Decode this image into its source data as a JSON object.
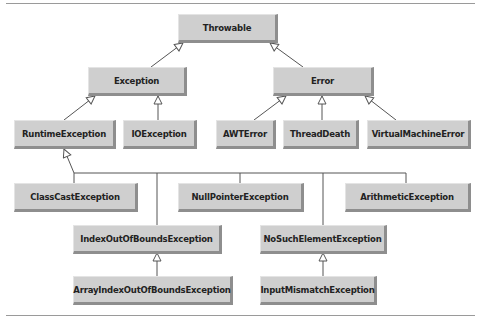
{
  "diagram": {
    "nodes": [
      {
        "id": "throwable",
        "label": "Throwable",
        "parent": null
      },
      {
        "id": "exception",
        "label": "Exception",
        "parent": "throwable"
      },
      {
        "id": "error",
        "label": "Error",
        "parent": "throwable"
      },
      {
        "id": "runtime",
        "label": "RuntimeException",
        "parent": "exception"
      },
      {
        "id": "io",
        "label": "IOException",
        "parent": "exception"
      },
      {
        "id": "awt",
        "label": "AWTError",
        "parent": "error"
      },
      {
        "id": "threaddeath",
        "label": "ThreadDeath",
        "parent": "error"
      },
      {
        "id": "vme",
        "label": "VirtualMachineError",
        "parent": "error"
      },
      {
        "id": "classcast",
        "label": "ClassCastException",
        "parent": "runtime"
      },
      {
        "id": "nullpointer",
        "label": "NullPointerException",
        "parent": "runtime"
      },
      {
        "id": "arithmetic",
        "label": "ArithmeticException",
        "parent": "runtime"
      },
      {
        "id": "ioob",
        "label": "IndexOutOfBoundsException",
        "parent": "runtime"
      },
      {
        "id": "nosuch",
        "label": "NoSuchElementException",
        "parent": "runtime"
      },
      {
        "id": "aioob",
        "label": "ArrayIndexOutOfBoundsException",
        "parent": "ioob"
      },
      {
        "id": "inputmismatch",
        "label": "InputMismatchException",
        "parent": "nosuch"
      }
    ]
  }
}
